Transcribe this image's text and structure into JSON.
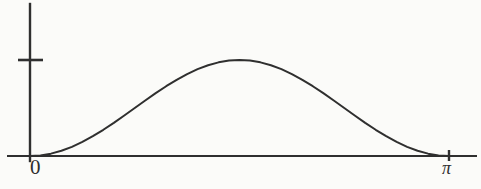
{
  "figure": {
    "name": "sine-squared-hump-plot",
    "background_color": "#fbfbf9",
    "ink_color": "#2f2f2f"
  },
  "labels": {
    "origin": "0",
    "right_tick": "π"
  },
  "chart_data": {
    "type": "line",
    "title": "",
    "xlabel": "",
    "ylabel": "",
    "xlim": [
      0,
      3.14159
    ],
    "ylim": [
      0,
      1.19
    ],
    "grid": false,
    "legend": null,
    "xticks": [
      0,
      3.14159
    ],
    "xticklabels": [
      "0",
      "π"
    ],
    "yticks": [
      1
    ],
    "yticklabels": [
      ""
    ],
    "annotations": [
      "y-axis tick dash marks the curve maximum height",
      "curve meets the x-axis tangentially at x=0 and x=π"
    ],
    "series": [
      {
        "name": "curve",
        "color": "#2f2f2f",
        "linewidth": 2,
        "x": [
          0.0,
          0.0785,
          0.1571,
          0.2356,
          0.3142,
          0.3927,
          0.4712,
          0.5498,
          0.6283,
          0.7069,
          0.7854,
          0.8639,
          0.9425,
          1.021,
          1.0996,
          1.1781,
          1.2566,
          1.3352,
          1.4137,
          1.4923,
          1.5708,
          1.6493,
          1.7279,
          1.8064,
          1.885,
          1.9635,
          2.042,
          2.1206,
          2.1991,
          2.2777,
          2.3562,
          2.4347,
          2.5133,
          2.5918,
          2.6704,
          2.7489,
          2.8274,
          2.906,
          2.9845,
          3.0631,
          3.1416
        ],
        "y": [
          0.0,
          0.006,
          0.0245,
          0.0545,
          0.0955,
          0.1464,
          0.2061,
          0.273,
          0.3455,
          0.4218,
          0.5,
          0.5782,
          0.6545,
          0.727,
          0.7939,
          0.8536,
          0.9045,
          0.9455,
          0.9755,
          0.9939,
          1.0,
          0.9939,
          0.9755,
          0.9455,
          0.9045,
          0.8536,
          0.7939,
          0.727,
          0.6545,
          0.5782,
          0.5,
          0.4218,
          0.3455,
          0.273,
          0.2061,
          0.1464,
          0.0955,
          0.0545,
          0.0245,
          0.006,
          0.0
        ]
      }
    ]
  },
  "geometry": {
    "x_axis": {
      "x1": 8,
      "x2": 476,
      "y": 156
    },
    "y_axis": {
      "x": 30,
      "y1": 4,
      "y2": 161
    },
    "y_tick": {
      "x1": 18,
      "x2": 43,
      "y": 60
    },
    "x_tick": {
      "x": 449,
      "y1": 150,
      "y2": 161
    },
    "curve_px": {
      "x_left": 30,
      "x_right": 449,
      "y_base": 156,
      "y_peak": 60
    }
  }
}
